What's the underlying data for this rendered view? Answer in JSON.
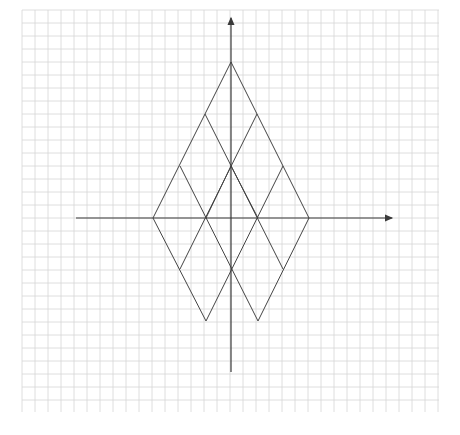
{
  "figure": {
    "width": 460,
    "height": 435,
    "background": "#ffffff",
    "grid": {
      "x0": 22,
      "y0": 10,
      "x1": 439,
      "y1": 412,
      "spacing": 13,
      "color": "#d6d6d6"
    },
    "axes": {
      "color": "#3a3a3a",
      "x_axis": {
        "x_start": 76,
        "x_end": 392,
        "y": 218,
        "arrow": "right"
      },
      "y_axis": {
        "x": 231,
        "y_start": 372,
        "y_end": 18,
        "arrow": "up"
      }
    },
    "lattice": {
      "description": "Rhombus lattice (large rhombus subdivided into diamonds)",
      "line_color": "#444444",
      "vertices": [
        {
          "x": 231,
          "y": 62
        },
        {
          "x": 205,
          "y": 114
        },
        {
          "x": 257,
          "y": 114
        },
        {
          "x": 180,
          "y": 166
        },
        {
          "x": 231,
          "y": 166
        },
        {
          "x": 283,
          "y": 166
        },
        {
          "x": 153,
          "y": 218
        },
        {
          "x": 206,
          "y": 218
        },
        {
          "x": 258,
          "y": 218
        },
        {
          "x": 309,
          "y": 218
        },
        {
          "x": 180,
          "y": 269
        },
        {
          "x": 231,
          "y": 269
        },
        {
          "x": 283,
          "y": 269
        },
        {
          "x": 206,
          "y": 321
        },
        {
          "x": 258,
          "y": 321
        }
      ],
      "segments": [
        [
          231,
          62,
          153,
          218
        ],
        [
          231,
          62,
          309,
          218
        ],
        [
          205,
          114,
          283,
          269
        ],
        [
          257,
          114,
          180,
          269
        ],
        [
          180,
          166,
          258,
          321
        ],
        [
          283,
          166,
          206,
          321
        ],
        [
          153,
          218,
          206,
          321
        ],
        [
          309,
          218,
          258,
          321
        ],
        [
          206,
          218,
          231,
          166
        ],
        [
          258,
          218,
          231,
          166
        ]
      ]
    }
  }
}
